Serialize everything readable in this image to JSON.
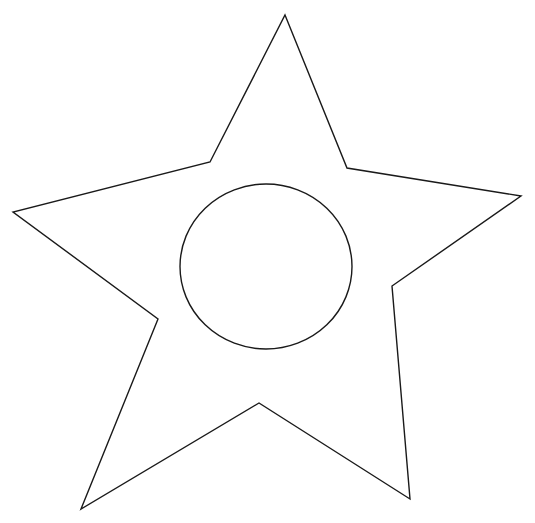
{
  "canvas": {
    "width": 535,
    "height": 523,
    "background": "#ffffff"
  },
  "figure": {
    "title": "",
    "stroke_color": "#1a1a1a",
    "stroke_width": 1.4,
    "star": {
      "points": [
        [
          285,
          15
        ],
        [
          347,
          168
        ],
        [
          521,
          196
        ],
        [
          392,
          286
        ],
        [
          410,
          499
        ],
        [
          259,
          403
        ],
        [
          81,
          509
        ],
        [
          158,
          319
        ],
        [
          13,
          212
        ],
        [
          210,
          162
        ]
      ]
    },
    "circle": {
      "cx": 266,
      "cy": 266.5,
      "rx": 86,
      "ry": 82.5
    }
  }
}
